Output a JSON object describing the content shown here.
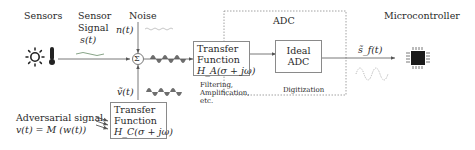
{
  "labels": {
    "sensors": "Sensors",
    "sensor_signal_line1": "Sensor",
    "sensor_signal_line2": "Signal",
    "sensor_signal_symbol": "s(t)",
    "noise": "Noise",
    "noise_symbol": "n(t)",
    "sum_symbol": "Σ",
    "adv_filtered_symbol": "ṽ(t)",
    "adversarial_line1": "Adversarial signal",
    "adversarial_line2": "v(t) = M (w(t))",
    "adc_group": "ADC",
    "digitization": "Digitization",
    "output_symbol": "s̃_f(t)",
    "microcontroller": "Microcontroller"
  },
  "blocks": {
    "transfer_a": {
      "line1": "Transfer",
      "line2": "Function",
      "line3": "H_A(σ + jω)",
      "caption_line1": "Filtering,",
      "caption_line2": "Amplification,",
      "caption_line3": "etc."
    },
    "transfer_c": {
      "line1": "Transfer",
      "line2": "Function",
      "line3": "H_C(σ + jω)"
    },
    "ideal_adc": {
      "line1": "Ideal",
      "line2": "ADC"
    }
  },
  "icons": [
    "sun-icon",
    "thermometer-icon",
    "microchip-icon",
    "sum-junction-icon"
  ],
  "colors": {
    "line": "#555555",
    "box_border": "#8a8a8a",
    "dotted": "#888888",
    "signal_green": "#7a9a7a",
    "noise_gray": "#b0b0b0",
    "burst": "#555555"
  }
}
